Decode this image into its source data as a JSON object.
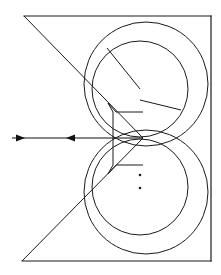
{
  "figure": {
    "background_color": "#ffffff",
    "line_color": "#1a1a1a",
    "width": 221,
    "height": 275,
    "caption": "",
    "elements": {
      "frame": {
        "name": "outer-frame",
        "top_edge": {
          "x1": 24,
          "y1": 16,
          "x2": 211,
          "y2": 16
        },
        "right_edge": {
          "x1": 211,
          "y1": 16,
          "x2": 211,
          "y2": 261
        },
        "bottom_edge": {
          "x1": 22,
          "y1": 261,
          "x2": 211,
          "y2": 261
        }
      },
      "wedge": {
        "name": "triangular-wedge",
        "upper_diagonal": {
          "x1": 24,
          "y1": 16,
          "x2": 143,
          "y2": 138
        },
        "lower_diagonal": {
          "x1": 22,
          "y1": 261,
          "x2": 143,
          "y2": 138
        },
        "apex": {
          "x": 143,
          "y": 138
        }
      },
      "circles": [
        {
          "name": "upper-outer-circle",
          "cx": 146,
          "cy": 84,
          "r": 62
        },
        {
          "name": "upper-inner-circle",
          "cx": 140,
          "cy": 89,
          "r": 48
        },
        {
          "name": "lower-outer-circle",
          "cx": 146,
          "cy": 192,
          "r": 62
        },
        {
          "name": "lower-inner-circle",
          "cx": 140,
          "cy": 187,
          "r": 48
        }
      ],
      "radius_lines": [
        {
          "name": "radius-line-upper",
          "x1": 107,
          "y1": 48,
          "x2": 140,
          "y2": 89
        },
        {
          "name": "radius-line-lower",
          "x1": 140,
          "y1": 100,
          "x2": 181,
          "y2": 110
        }
      ],
      "bracket": {
        "name": "center-bracket",
        "points": "143,112 116,112 108,103 113,112 113,165 108,174 116,165 143,165"
      },
      "axis_line": {
        "name": "horizontal-axis",
        "x1": 12,
        "y1": 138,
        "x2": 143,
        "y2": 138,
        "arrowheads": [
          {
            "name": "arrowhead-right",
            "x": 25,
            "y": 138,
            "direction": "right"
          },
          {
            "name": "arrowhead-left",
            "x": 66,
            "y": 138,
            "direction": "left"
          }
        ]
      },
      "dots": [
        {
          "name": "center-dot-upper",
          "cx": 140,
          "cy": 175,
          "r": 1.3
        },
        {
          "name": "center-dot-lower",
          "cx": 140,
          "cy": 188,
          "r": 1.3
        }
      ]
    }
  }
}
